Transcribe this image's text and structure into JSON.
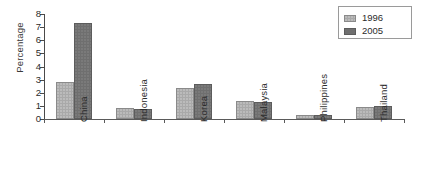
{
  "chart_data": {
    "type": "bar",
    "title": "",
    "xlabel": "",
    "ylabel": "Percentage",
    "categories": [
      "China",
      "Indonesia",
      "Korea",
      "Malaysia",
      "Philippines",
      "Thailand"
    ],
    "series": [
      {
        "name": "1996",
        "color": "#a9a9a9",
        "values": [
          2.8,
          0.85,
          2.4,
          1.4,
          0.3,
          0.95
        ]
      },
      {
        "name": "2005",
        "color": "#6f6f6f",
        "values": [
          7.3,
          0.8,
          2.7,
          1.3,
          0.3,
          1.0
        ]
      }
    ],
    "ylim": [
      0,
      8
    ],
    "yticks": [
      "0",
      "1",
      "2",
      "3",
      "4",
      "5",
      "6",
      "7",
      "8"
    ],
    "grid": false,
    "legend_position": "top-right",
    "legend_entries": [
      "1996",
      "2005"
    ]
  }
}
